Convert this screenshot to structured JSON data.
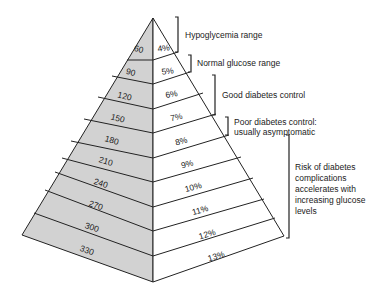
{
  "diagram": {
    "type": "glucose-pyramid",
    "colors": {
      "left_face": "#d2d2d2",
      "right_face": "#ffffff",
      "stroke": "#222222"
    },
    "layers": [
      {
        "glucose": "60",
        "a1c": "4%"
      },
      {
        "glucose": "90",
        "a1c": "5%"
      },
      {
        "glucose": "120",
        "a1c": "6%"
      },
      {
        "glucose": "150",
        "a1c": "7%"
      },
      {
        "glucose": "180",
        "a1c": "8%"
      },
      {
        "glucose": "210",
        "a1c": "9%"
      },
      {
        "glucose": "240",
        "a1c": "10%"
      },
      {
        "glucose": "270",
        "a1c": "11%"
      },
      {
        "glucose": "300",
        "a1c": "12%"
      },
      {
        "glucose": "330",
        "a1c": "13%"
      }
    ],
    "ranges": [
      {
        "lines": [
          "Hypoglycemia range"
        ]
      },
      {
        "lines": [
          "Normal glucose range"
        ]
      },
      {
        "lines": [
          "Good diabetes control"
        ]
      },
      {
        "lines": [
          "Poor diabetes control:",
          "usually asymptomatic"
        ]
      },
      {
        "lines": [
          "Risk of diabetes",
          "complications",
          "accelerates with",
          "increasing glucose",
          "levels"
        ]
      }
    ]
  }
}
